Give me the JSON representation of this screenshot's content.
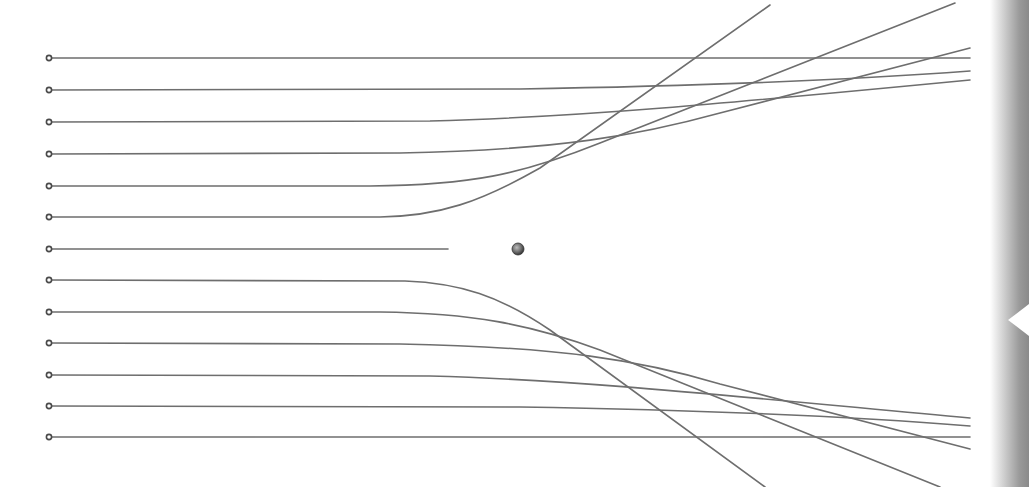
{
  "diagram": {
    "type": "particle-scattering-trajectories",
    "colors": {
      "background": "#ffffff",
      "trajectory": "#6e6e6e",
      "source_marker": "#4a4a4a",
      "nucleus": "#555555",
      "edge_bar": "#9a9a9a"
    },
    "nucleus": {
      "x": 518,
      "y": 249,
      "r": 6
    },
    "source_x": 49,
    "end_x": 970,
    "trajectories": [
      {
        "id": 1,
        "start_y": 58,
        "path": "M49 58 L970 58"
      },
      {
        "id": 2,
        "start_y": 90,
        "path": "M49 90 L520 89 C700 86 850 80 970 71"
      },
      {
        "id": 3,
        "start_y": 122,
        "path": "M49 122 L430 121 C580 117 720 104 970 80"
      },
      {
        "id": 4,
        "start_y": 154,
        "path": "M49 154 L400 153 C560 150 640 135 720 113 L970 48"
      },
      {
        "id": 5,
        "start_y": 186,
        "path": "M49 186 L370 186 C470 185 520 175 600 143 L955 3"
      },
      {
        "id": 6,
        "start_y": 217,
        "path": "M49 217 L380 217 C440 216 480 202 540 168 L770 5"
      },
      {
        "id": 7,
        "start_y": 249,
        "path": "M49 249 L448 249"
      },
      {
        "id": 8,
        "start_y": 280,
        "path": "M49 280 L405 281 C460 283 500 296 550 330 L765 487"
      },
      {
        "id": 9,
        "start_y": 312,
        "path": "M49 312 L380 312 C470 313 530 324 600 350 L940 487"
      },
      {
        "id": 10,
        "start_y": 343,
        "path": "M49 343 L400 344 C560 347 640 360 720 384 L970 449"
      },
      {
        "id": 11,
        "start_y": 375,
        "path": "M49 375 L430 376 C580 380 720 395 970 418"
      },
      {
        "id": 12,
        "start_y": 406,
        "path": "M49 406 L520 407 C700 410 850 416 970 426"
      },
      {
        "id": 13,
        "start_y": 437,
        "path": "M49 437 L970 437"
      }
    ]
  },
  "edge_bar": {
    "notch_direction": "left",
    "notch_y": 320
  }
}
